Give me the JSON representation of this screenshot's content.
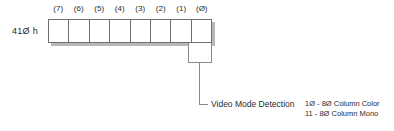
{
  "register": {
    "address_label": "41Ø h",
    "bit_indices": [
      "(7)",
      "(6)",
      "(5)",
      "(4)",
      "(3)",
      "(2)",
      "(1)",
      "(Ø)"
    ],
    "bit_values": [
      "",
      "",
      "",
      "",
      "",
      "",
      "",
      ""
    ]
  },
  "callout": {
    "title": "Video Mode Detection",
    "highlighted_bits": [
      "(1)",
      "(Ø)"
    ],
    "values": [
      "1Ø - 8Ø Column Color",
      "11  - 8Ø Column Mono"
    ]
  },
  "colors": {
    "outline": "#6f6f6f",
    "callout_outline": "#8a8a8a",
    "shadow": "#b8b8b8",
    "text": "#2b2b2b",
    "background": "#ffffff"
  }
}
